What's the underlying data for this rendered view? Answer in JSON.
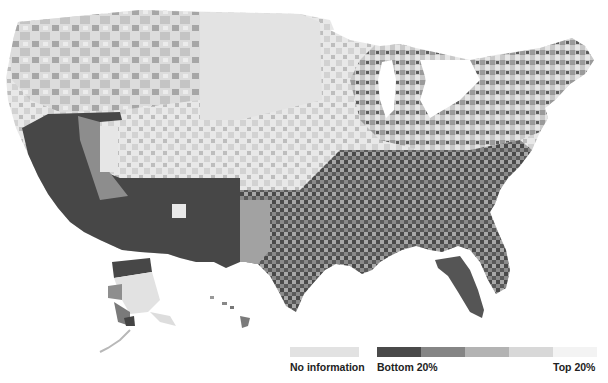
{
  "map": {
    "title": "",
    "type": "choropleth",
    "region": "United States counties",
    "scale": "grayscale quintiles"
  },
  "legend": {
    "no_information": {
      "label": "No information",
      "color": "#e2e2e2"
    },
    "scale_start_label": "Bottom 20%",
    "scale_end_label": "Top 20%",
    "bins": [
      {
        "name": "Bottom 20%",
        "color": "#4a4a4a"
      },
      {
        "name": "20-40%",
        "color": "#858585"
      },
      {
        "name": "40-60%",
        "color": "#b3b3b3"
      },
      {
        "name": "60-80%",
        "color": "#d8d8d8"
      },
      {
        "name": "Top 20%",
        "color": "#f3f3f3"
      }
    ]
  },
  "colors": {
    "darkest": "#464646",
    "dark": "#7e7e7e",
    "mid": "#adadad",
    "light": "#d6d6d6",
    "lightest": "#ededed",
    "background": "#ffffff"
  }
}
